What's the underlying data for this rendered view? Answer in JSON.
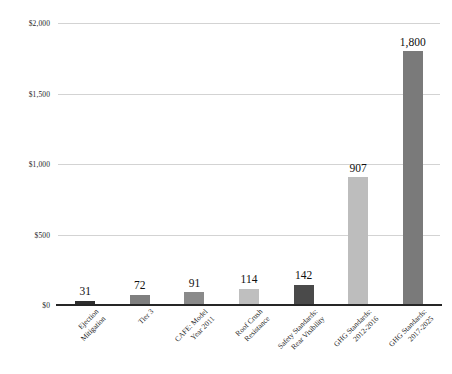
{
  "chart_data": {
    "type": "bar",
    "title": "",
    "subtitle": "",
    "xlabel": "",
    "ylabel": "",
    "ylim": [
      0,
      2000
    ],
    "grid": true,
    "legend": "none",
    "y_ticks": [
      {
        "value": 0,
        "label": "$0"
      },
      {
        "value": 500,
        "label": "$500"
      },
      {
        "value": 1000,
        "label": "$1,000"
      },
      {
        "value": 1500,
        "label": "$1,500"
      },
      {
        "value": 2000,
        "label": "$2,000"
      }
    ],
    "categories": [
      "Ejection Mitigation",
      "Tier 3",
      "CAFE: Model Year 2011",
      "Roof Crush Resistance",
      "Safety Standards: Rear Visibility",
      "GHG Standards: 2012-2016",
      "GHG Standards: 2017-2025"
    ],
    "category_lines": [
      [
        "Ejection",
        "Mitigation"
      ],
      [
        "Tier 3"
      ],
      [
        "CAFE: Model",
        "Year 2011"
      ],
      [
        "Roof Crush",
        "Resistance"
      ],
      [
        "Safety Standards:",
        "Rear Visibility"
      ],
      [
        "GHG Standards:",
        "2012-2016"
      ],
      [
        "GHG Standards:",
        "2017-2025"
      ]
    ],
    "values": [
      31,
      72,
      91,
      114,
      142,
      907,
      1800
    ],
    "value_labels": [
      "31",
      "72",
      "91",
      "114",
      "142",
      "907",
      "1,800"
    ],
    "bar_colors": [
      "#2e2e2e",
      "#7f7f7f",
      "#8a8a8a",
      "#bfbfbf",
      "#4a4a4a",
      "#bdbdbd",
      "#7a7a7a"
    ],
    "axis_color": "#262626",
    "gridline_color": "#d3d3d3",
    "background_color": "#ffffff"
  }
}
